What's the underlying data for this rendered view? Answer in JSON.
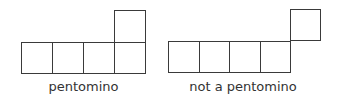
{
  "figures": [
    {
      "label": "pentomino"
    },
    {
      "label": "not a pentomino"
    }
  ]
}
